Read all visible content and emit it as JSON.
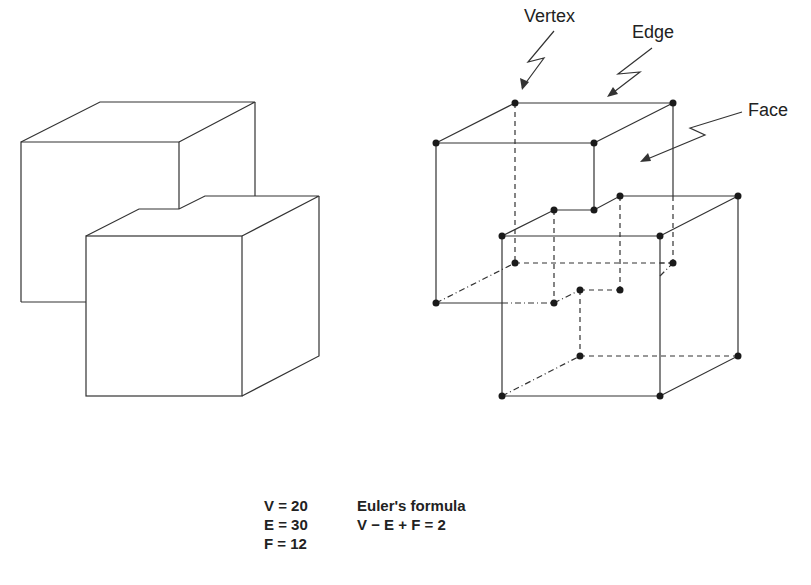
{
  "labels": {
    "vertex": "Vertex",
    "edge": "Edge",
    "face": "Face"
  },
  "counts": {
    "v": "V = 20",
    "e": "E = 30",
    "f": "F = 12"
  },
  "formula": {
    "title": "Euler's formula",
    "equation": "V − E + F = 2"
  },
  "colors": {
    "line": "#333333",
    "vertex_dot": "#1a1a1a",
    "background": "#ffffff"
  }
}
